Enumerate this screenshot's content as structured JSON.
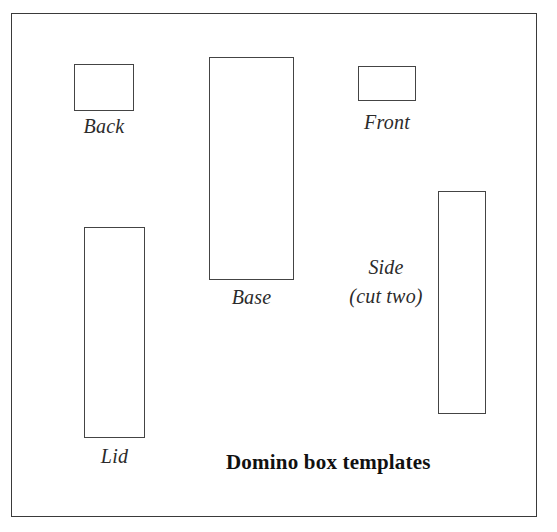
{
  "figure": {
    "caption": "Domino box templates",
    "frame": {
      "x": 11,
      "y": 13,
      "width": 526,
      "height": 504
    },
    "parts": [
      {
        "id": "back",
        "label": "Back",
        "rect": {
          "x": 73,
          "y": 63,
          "width": 60,
          "height": 47
        },
        "label_pos": {
          "x": 73,
          "y": 114,
          "width": 60
        }
      },
      {
        "id": "base",
        "label": "Base",
        "rect": {
          "x": 208,
          "y": 56,
          "width": 85,
          "height": 223
        },
        "label_pos": {
          "x": 208,
          "y": 285,
          "width": 85
        }
      },
      {
        "id": "front",
        "label": "Front",
        "rect": {
          "x": 357,
          "y": 65,
          "width": 58,
          "height": 35
        },
        "label_pos": {
          "x": 352,
          "y": 110,
          "width": 68
        }
      },
      {
        "id": "lid",
        "label": "Lid",
        "rect": {
          "x": 83,
          "y": 226,
          "width": 61,
          "height": 211
        },
        "label_pos": {
          "x": 83,
          "y": 444,
          "width": 61
        }
      },
      {
        "id": "side",
        "label": "Side\n(cut two)",
        "rect": {
          "x": 437,
          "y": 190,
          "width": 48,
          "height": 223
        },
        "label_pos": {
          "x": 330,
          "y": 252,
          "width": 110
        }
      }
    ],
    "caption_pos": {
      "x": 225,
      "y": 449
    },
    "colors": {
      "frame_stroke": "#3a3a3a",
      "part_stroke": "#444444",
      "label_text": "#2b2b2b",
      "caption_text": "#111111",
      "background": "#ffffff"
    }
  }
}
